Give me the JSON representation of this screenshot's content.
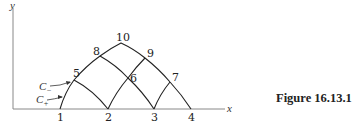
{
  "figure": {
    "caption": "Figure 16.13.1",
    "axes": {
      "x_label": "x",
      "y_label": "y"
    },
    "nodes": [
      {
        "id": "1",
        "label": "1"
      },
      {
        "id": "2",
        "label": "2"
      },
      {
        "id": "3",
        "label": "3"
      },
      {
        "id": "4",
        "label": "4"
      },
      {
        "id": "5",
        "label": "5"
      },
      {
        "id": "6",
        "label": "6"
      },
      {
        "id": "7",
        "label": "7"
      },
      {
        "id": "8",
        "label": "8"
      },
      {
        "id": "9",
        "label": "9"
      },
      {
        "id": "10",
        "label": "10"
      }
    ],
    "characteristics": {
      "c_minus": {
        "base": "C",
        "sub": "−"
      },
      "c_plus": {
        "base": "C",
        "sub": "+"
      }
    },
    "edges": [
      [
        "1",
        "5"
      ],
      [
        "5",
        "8"
      ],
      [
        "8",
        "10"
      ],
      [
        "10",
        "9"
      ],
      [
        "9",
        "7"
      ],
      [
        "7",
        "4"
      ],
      [
        "5",
        "2"
      ],
      [
        "2",
        "6"
      ],
      [
        "6",
        "9"
      ],
      [
        "8",
        "6"
      ],
      [
        "6",
        "3"
      ],
      [
        "3",
        "7"
      ]
    ]
  }
}
